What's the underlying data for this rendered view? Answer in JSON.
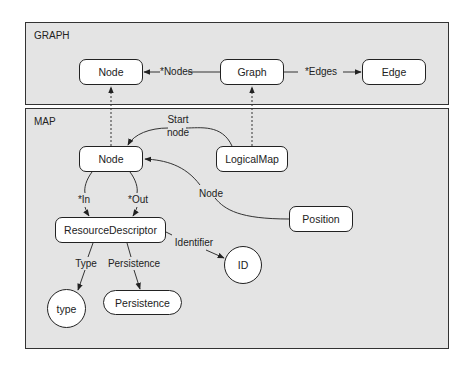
{
  "panels": {
    "graph": {
      "title": "GRAPH"
    },
    "map": {
      "title": "MAP"
    }
  },
  "nodes": {
    "graph_node": "Node",
    "graph": "Graph",
    "edge": "Edge",
    "map_node": "Node",
    "logical_map": "LogicalMap",
    "position": "Position",
    "resource_descriptor": "ResourceDescriptor",
    "id": "ID",
    "type": "type",
    "persistence": "Persistence"
  },
  "edges": {
    "nodes": "*Nodes",
    "edges": "*Edges",
    "start_node_line1": "Start",
    "start_node_line2": "node",
    "position_node": "Node",
    "in": "*In",
    "out": "*Out",
    "identifier": "Identifier",
    "type": "Type",
    "persistence": "Persistence"
  },
  "colors": {
    "panel_bg": "#e4e4e4",
    "border": "#333333",
    "node_bg": "#ffffff"
  }
}
